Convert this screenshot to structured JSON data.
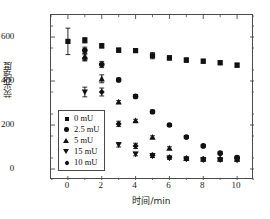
{
  "chart_data": {
    "type": "scatter",
    "title": "",
    "xlabel": "时间/min",
    "ylabel": "荧光强度",
    "xlim": [
      -1,
      11
    ],
    "ylim": [
      -50,
      700
    ],
    "xticks": [
      0,
      2,
      4,
      6,
      8,
      10
    ],
    "yticks": [
      0,
      200,
      400,
      600
    ],
    "grid": false,
    "legend_position": "lower-left-inside",
    "x": [
      0,
      1,
      2,
      3,
      4,
      5,
      6,
      7,
      8,
      9,
      10
    ],
    "series": [
      {
        "name": "0 mU",
        "marker": "square",
        "values": [
          580,
          585,
          560,
          540,
          538,
          515,
          505,
          495,
          490,
          483,
          472
        ],
        "errors": [
          60,
          12,
          10,
          10,
          8,
          14,
          10,
          10,
          9,
          9,
          9
        ]
      },
      {
        "name": "2.5 mU",
        "marker": "circle",
        "values": [
          null,
          540,
          475,
          405,
          330,
          260,
          200,
          145,
          105,
          72,
          52
        ],
        "errors": [
          null,
          14,
          14,
          8,
          8,
          8,
          6,
          6,
          6,
          6,
          6
        ]
      },
      {
        "name": "5 mU",
        "marker": "triangle-up",
        "values": [
          null,
          510,
          410,
          305,
          220,
          145,
          95,
          48,
          45,
          45,
          45
        ],
        "errors": [
          null,
          16,
          18,
          6,
          6,
          6,
          6,
          6,
          5,
          5,
          5
        ]
      },
      {
        "name": "15 mU",
        "marker": "triangle-down",
        "values": [
          null,
          350,
          205,
          110,
          68,
          60,
          50,
          45,
          42,
          42,
          40
        ],
        "errors": [
          null,
          22,
          14,
          10,
          8,
          8,
          6,
          6,
          5,
          5,
          5
        ]
      },
      {
        "name": "10 mU",
        "marker": "diamond",
        "values": [
          null,
          505,
          350,
          205,
          105,
          62,
          52,
          48,
          45,
          45,
          48
        ],
        "errors": [
          null,
          14,
          18,
          12,
          12,
          8,
          6,
          6,
          5,
          5,
          8
        ]
      }
    ]
  },
  "axes": {
    "xtick_labels": [
      "0",
      "2",
      "4",
      "6",
      "8",
      "10"
    ],
    "ytick_labels": [
      "0",
      "200",
      "400",
      "600"
    ],
    "xlabel": "时间/min",
    "ylabel": "荧光强度"
  },
  "legend": {
    "items": [
      {
        "label": "0 mU",
        "marker": "square"
      },
      {
        "label": "2.5 mU",
        "marker": "circle"
      },
      {
        "label": "5 mU",
        "marker": "triangle-up"
      },
      {
        "label": "15 mU",
        "marker": "triangle-down"
      },
      {
        "label": "10 mU",
        "marker": "diamond"
      }
    ]
  },
  "colors": {
    "marker": "#111111",
    "axis": "#4a4a4a",
    "text": "#1a1a1a",
    "background": "#ffffff"
  }
}
